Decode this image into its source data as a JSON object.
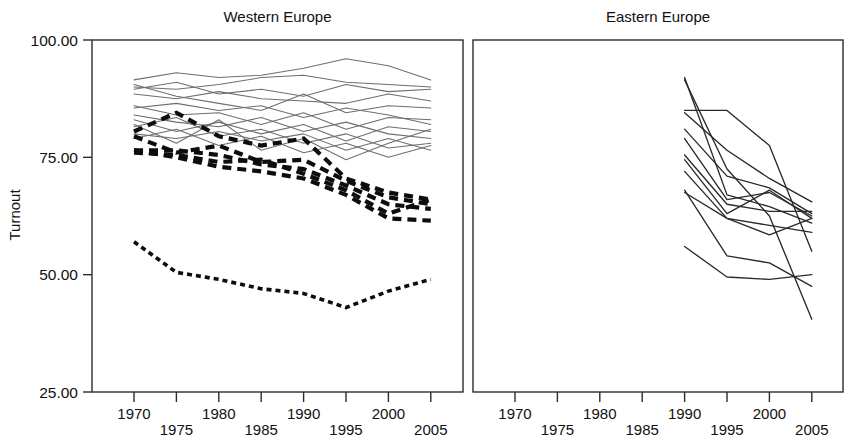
{
  "figure": {
    "width": 859,
    "height": 446,
    "background": "#ffffff",
    "ylabel": "Turnout"
  },
  "chart_data": {
    "type": "line",
    "title": "",
    "xlabel": "",
    "ylabel": "Turnout",
    "ylim": [
      25.0,
      100.0
    ],
    "xlim": [
      1968,
      2007
    ],
    "grid": false,
    "legend": "none",
    "y_tick_labels": [
      "100.00",
      "75.00",
      "50.00",
      "25.00"
    ],
    "y_tick_values": [
      100.0,
      75.0,
      50.0,
      25.0
    ],
    "x_tick_labels": [
      "1970",
      "1975",
      "1980",
      "1985",
      "1990",
      "1995",
      "2000",
      "2005"
    ],
    "x_tick_values": [
      1970,
      1975,
      1980,
      1985,
      1990,
      1995,
      2000,
      2005
    ],
    "x_tick_label_rows": [
      0,
      1,
      0,
      1,
      0,
      1,
      0,
      1
    ],
    "panels": [
      {
        "name": "western-europe",
        "title": "Western Europe",
        "series": [
          {
            "name": "we-solid-1",
            "style": "solid-gray",
            "x": [
              1970,
              1975,
              1980,
              1985,
              1990,
              1995,
              2000,
              2005
            ],
            "values": [
              91.5,
              93.0,
              92.0,
              92.5,
              94.0,
              96.0,
              94.5,
              91.5
            ]
          },
          {
            "name": "we-solid-2",
            "style": "solid-gray",
            "x": [
              1970,
              1975,
              1980,
              1985,
              1990,
              1995,
              2000,
              2005
            ],
            "values": [
              90.0,
              89.5,
              90.5,
              92.0,
              92.5,
              91.0,
              90.5,
              90.0
            ]
          },
          {
            "name": "we-solid-3",
            "style": "solid-gray",
            "x": [
              1970,
              1975,
              1980,
              1985,
              1990,
              1995,
              2000,
              2005
            ],
            "values": [
              89.5,
              91.0,
              88.5,
              89.5,
              88.0,
              90.5,
              89.0,
              89.5
            ]
          },
          {
            "name": "we-solid-4",
            "style": "solid-gray",
            "x": [
              1970,
              1975,
              1980,
              1985,
              1990,
              1995,
              2000,
              2005
            ],
            "values": [
              88.5,
              87.5,
              89.0,
              87.5,
              87.0,
              86.5,
              88.5,
              87.0
            ]
          },
          {
            "name": "we-solid-5",
            "style": "solid-gray",
            "x": [
              1970,
              1975,
              1980,
              1985,
              1990,
              1995,
              2000,
              2005
            ],
            "values": [
              90.5,
              88.0,
              86.5,
              85.0,
              88.5,
              84.5,
              86.0,
              85.5
            ]
          },
          {
            "name": "we-solid-6",
            "style": "solid-gray",
            "x": [
              1970,
              1975,
              1980,
              1985,
              1990,
              1995,
              2000,
              2005
            ],
            "values": [
              85.5,
              86.5,
              85.0,
              86.0,
              83.5,
              85.5,
              84.0,
              82.0
            ]
          },
          {
            "name": "we-solid-7",
            "style": "solid-gray",
            "x": [
              1970,
              1975,
              1980,
              1985,
              1990,
              1995,
              2000,
              2005
            ],
            "values": [
              86.0,
              84.0,
              84.5,
              82.0,
              84.5,
              81.0,
              83.5,
              83.0
            ]
          },
          {
            "name": "we-solid-8",
            "style": "solid-gray",
            "x": [
              1970,
              1975,
              1980,
              1985,
              1990,
              1995,
              2000,
              2005
            ],
            "values": [
              84.0,
              82.5,
              81.5,
              83.5,
              80.5,
              82.5,
              80.0,
              79.0
            ]
          },
          {
            "name": "we-solid-9",
            "style": "solid-gray",
            "x": [
              1970,
              1975,
              1980,
              1985,
              1990,
              1995,
              2000,
              2005
            ],
            "values": [
              83.0,
              80.5,
              82.5,
              80.0,
              82.0,
              78.5,
              81.5,
              80.5
            ]
          },
          {
            "name": "we-solid-10",
            "style": "solid-gray",
            "x": [
              1970,
              1975,
              1980,
              1985,
              1990,
              1995,
              2000,
              2005
            ],
            "values": [
              81.5,
              83.5,
              79.5,
              81.0,
              78.0,
              80.0,
              77.0,
              78.0
            ]
          },
          {
            "name": "we-solid-11",
            "style": "solid-gray",
            "x": [
              1970,
              1975,
              1980,
              1985,
              1990,
              1995,
              2000,
              2005
            ],
            "values": [
              80.0,
              79.0,
              80.5,
              78.5,
              80.0,
              76.5,
              79.0,
              76.5
            ]
          },
          {
            "name": "we-solid-12",
            "style": "solid-gray",
            "x": [
              1970,
              1975,
              1980,
              1985,
              1990,
              1995,
              2000,
              2005
            ],
            "values": [
              79.0,
              81.0,
              77.5,
              79.5,
              76.0,
              78.0,
              75.0,
              77.5
            ]
          },
          {
            "name": "we-solid-13",
            "style": "solid-gray",
            "x": [
              1970,
              1975,
              1980,
              1985,
              1990,
              1995,
              2000,
              2005
            ],
            "values": [
              82.0,
              78.0,
              83.0,
              76.5,
              79.0,
              74.5,
              78.0,
              81.0
            ]
          },
          {
            "name": "we-dash-1",
            "style": "dashed-black",
            "x": [
              1970,
              1975,
              1980,
              1985,
              1990,
              1995,
              2000,
              2005
            ],
            "values": [
              80.5,
              84.5,
              79.5,
              77.5,
              79.0,
              70.5,
              67.5,
              66.0
            ]
          },
          {
            "name": "we-dash-2",
            "style": "dashed-black",
            "x": [
              1970,
              1975,
              1980,
              1985,
              1990,
              1995,
              2000,
              2005
            ],
            "values": [
              79.5,
              76.0,
              77.5,
              74.0,
              74.5,
              70.0,
              66.5,
              65.0
            ]
          },
          {
            "name": "we-dash-3",
            "style": "dashed-black",
            "x": [
              1970,
              1975,
              1980,
              1985,
              1990,
              1995,
              2000,
              2005
            ],
            "values": [
              76.5,
              76.5,
              75.5,
              73.5,
              72.5,
              69.0,
              65.0,
              64.0
            ]
          },
          {
            "name": "we-dash-4",
            "style": "dashed-black",
            "x": [
              1970,
              1975,
              1980,
              1985,
              1990,
              1995,
              2000,
              2005
            ],
            "values": [
              76.0,
              75.5,
              74.0,
              74.5,
              71.5,
              68.0,
              63.0,
              66.0
            ]
          },
          {
            "name": "we-dash-5",
            "style": "dashed-black",
            "x": [
              1970,
              1975,
              1980,
              1985,
              1990,
              1995,
              2000,
              2005
            ],
            "values": [
              76.5,
              75.0,
              73.0,
              72.0,
              70.5,
              67.0,
              62.0,
              61.5
            ]
          },
          {
            "name": "we-dot-low",
            "style": "dotted-black",
            "x": [
              1970,
              1975,
              1980,
              1985,
              1990,
              1995,
              2000,
              2005
            ],
            "values": [
              57.0,
              50.5,
              49.0,
              47.0,
              46.0,
              43.0,
              46.5,
              49.0
            ]
          }
        ]
      },
      {
        "name": "eastern-europe",
        "title": "Eastern Europe",
        "series": [
          {
            "name": "ee-1",
            "style": "solid-black",
            "x": [
              1990,
              1995,
              2000,
              2005
            ],
            "values": [
              92.0,
              67.0,
              64.5,
              61.0
            ]
          },
          {
            "name": "ee-2",
            "style": "solid-black",
            "x": [
              1990,
              1995,
              2000,
              2005
            ],
            "values": [
              91.5,
              72.5,
              62.5,
              40.5
            ]
          },
          {
            "name": "ee-3",
            "style": "solid-black",
            "x": [
              1990,
              1995,
              2000,
              2005
            ],
            "values": [
              85.0,
              85.0,
              77.5,
              55.0
            ]
          },
          {
            "name": "ee-4",
            "style": "solid-black",
            "x": [
              1990,
              1995,
              2000,
              2005
            ],
            "values": [
              84.5,
              76.5,
              70.5,
              65.5
            ]
          },
          {
            "name": "ee-5",
            "style": "solid-black",
            "x": [
              1990,
              1995,
              2000,
              2005
            ],
            "values": [
              81.0,
              71.0,
              68.5,
              63.0
            ]
          },
          {
            "name": "ee-6",
            "style": "solid-black",
            "x": [
              1990,
              1995,
              2000,
              2005
            ],
            "values": [
              79.0,
              66.0,
              67.5,
              62.5
            ]
          },
          {
            "name": "ee-7",
            "style": "solid-black",
            "x": [
              1990,
              1995,
              2000,
              2005
            ],
            "values": [
              75.5,
              65.0,
              63.5,
              63.5
            ]
          },
          {
            "name": "ee-8",
            "style": "solid-black",
            "x": [
              1990,
              1995,
              2000,
              2005
            ],
            "values": [
              74.5,
              63.0,
              68.0,
              62.0
            ]
          },
          {
            "name": "ee-9",
            "style": "solid-black",
            "x": [
              1990,
              1995,
              2000,
              2005
            ],
            "values": [
              72.0,
              62.0,
              60.5,
              59.0
            ]
          },
          {
            "name": "ee-10",
            "style": "solid-black",
            "x": [
              1990,
              1995,
              2000,
              2005
            ],
            "values": [
              68.0,
              54.0,
              52.5,
              47.5
            ]
          },
          {
            "name": "ee-11",
            "style": "solid-black",
            "x": [
              1990,
              1995,
              2000,
              2005
            ],
            "values": [
              67.5,
              62.0,
              58.5,
              62.0
            ]
          },
          {
            "name": "ee-12",
            "style": "solid-black",
            "x": [
              1990,
              1995,
              2000,
              2005
            ],
            "values": [
              56.0,
              49.5,
              49.0,
              50.0
            ]
          }
        ]
      }
    ]
  }
}
